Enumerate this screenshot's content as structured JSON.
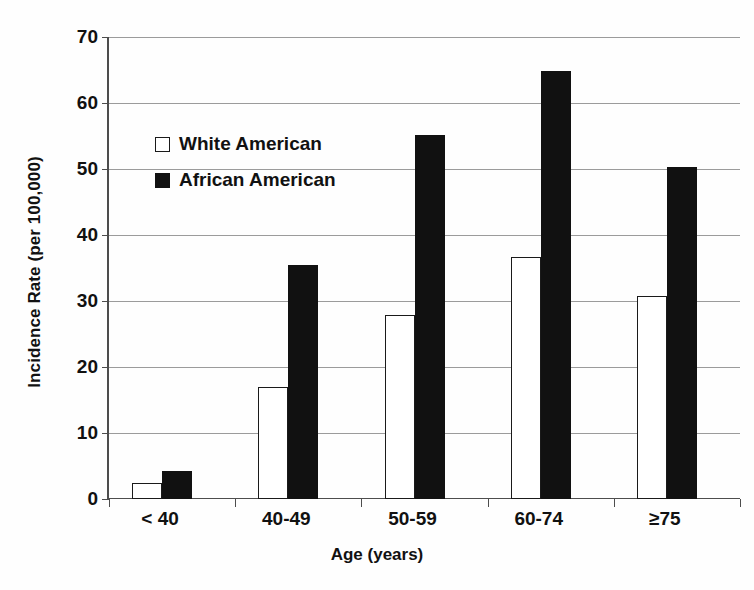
{
  "chart_data": {
    "type": "bar",
    "title": "",
    "xlabel": "Age (years)",
    "ylabel": "Incidence Rate (per 100,000)",
    "categories": [
      "< 40",
      "40-49",
      "50-59",
      "60-74",
      "≥75"
    ],
    "series": [
      {
        "name": "White American",
        "marker": "open-square",
        "color": "#ffffff",
        "values": [
          2.4,
          16.9,
          27.9,
          36.6,
          30.7
        ]
      },
      {
        "name": "African American",
        "marker": "filled-square",
        "color": "#111111",
        "values": [
          4.2,
          35.4,
          55.1,
          64.8,
          50.3
        ]
      }
    ],
    "ylim": [
      0,
      70
    ],
    "yticks": [
      0,
      10,
      20,
      30,
      40,
      50,
      60,
      70
    ],
    "grid": "horizontal",
    "legend_position": "upper-left-inside"
  },
  "axes": {
    "y_title": "Incidence Rate (per 100,000)",
    "x_title": "Age (years)"
  },
  "legend": {
    "entries": [
      {
        "label": "White American"
      },
      {
        "label": "African American"
      }
    ]
  }
}
